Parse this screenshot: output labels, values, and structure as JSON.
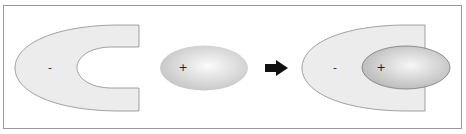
{
  "diagram": {
    "frame": {
      "border_color": "#9a9a9a"
    },
    "colors": {
      "c_fill": "#ececec",
      "c_stroke": "#8a8a8a",
      "ellipse_center": "#fafafa",
      "ellipse_edge": "#c2c2c2",
      "ellipse_stroke": "#777777",
      "arrow": "#111111"
    },
    "panels": [
      {
        "name": "negative-c-shape",
        "shape": "c-shape",
        "charge_label": "-"
      },
      {
        "name": "positive-ellipse",
        "shape": "ellipse",
        "charge_label": "+"
      },
      {
        "name": "arrow",
        "shape": "right-arrow",
        "icon": "arrow-right-icon"
      },
      {
        "name": "combined",
        "shape": "c-shape-with-ellipse",
        "labels": {
          "negative": "-",
          "positive": "+"
        }
      }
    ]
  }
}
